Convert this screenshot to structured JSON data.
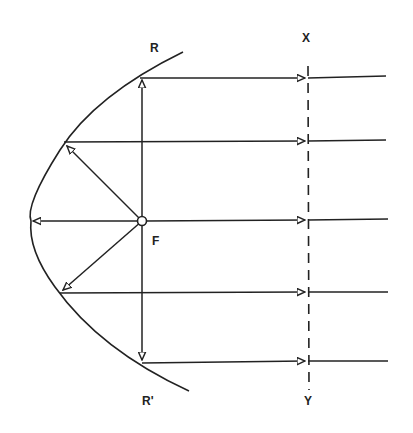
{
  "diagram": {
    "labels": {
      "R": "R",
      "R_prime": "R'",
      "F": "F",
      "X": "X",
      "Y": "Y"
    },
    "colors": {
      "stroke": "#222222",
      "background": "#ffffff"
    },
    "focus": {
      "x": 142,
      "y": 221
    },
    "vertex": {
      "x": 30,
      "y": 221
    },
    "reflection_points": [
      {
        "x": 140,
        "y": 78
      },
      {
        "x": 64,
        "y": 142
      },
      {
        "x": 30,
        "y": 221
      },
      {
        "x": 60,
        "y": 293
      },
      {
        "x": 142,
        "y": 362
      }
    ],
    "parallel_rays_y": [
      78,
      140,
      219,
      292,
      361
    ],
    "wavefront_line": {
      "x": 308,
      "y_top": 66,
      "y_bottom": 390,
      "style": "dashed"
    }
  }
}
